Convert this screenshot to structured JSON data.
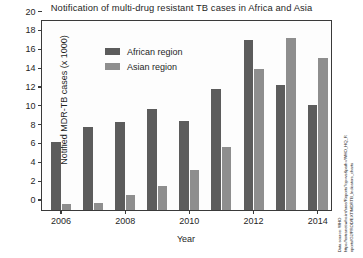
{
  "chart_data": {
    "type": "bar",
    "title": "Notification of multi-drug resistant TB cases in Africa and Asia",
    "xlabel": "Year",
    "ylabel": "Notified MDR-TB cases (x 1000)",
    "categories": [
      "2006",
      "2007",
      "2008",
      "2009",
      "2010",
      "2011",
      "2012",
      "2013",
      "2014"
    ],
    "xticklabels": [
      "2006",
      "2008",
      "2010",
      "2012",
      "2014"
    ],
    "yticklabels": [
      "0",
      "2",
      "4",
      "6",
      "8",
      "10",
      "12",
      "14",
      "16",
      "18",
      "20"
    ],
    "yticks": [
      0,
      2,
      4,
      6,
      8,
      10,
      12,
      14,
      16,
      18,
      20
    ],
    "ylim": [
      0,
      20
    ],
    "grid": false,
    "legend_position": "top-left-inside",
    "series": [
      {
        "name": "African region",
        "color": "#5c5c5c",
        "values": [
          7.2,
          8.8,
          9.3,
          10.7,
          9.5,
          12.8,
          18.1,
          13.3,
          11.1
        ]
      },
      {
        "name": "Asian region",
        "color": "#8e8e8e",
        "values": [
          0.6,
          0.75,
          1.6,
          2.6,
          4.2,
          6.7,
          15.0,
          18.3,
          16.1
        ]
      }
    ]
  },
  "source_note": {
    "line1": "Data source: WHO",
    "line2": "https://extranet.who.int/sree/Reports?op=vs&path=/WHO_HQ_R",
    "line3": "eports/G2/PROD/EXT/MDRTB_Indicators_charts"
  }
}
